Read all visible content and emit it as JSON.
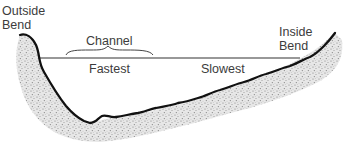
{
  "diagram": {
    "type": "river-channel-cross-section",
    "labels": {
      "outside_bend": [
        "Outside",
        "Bend"
      ],
      "inside_bend": [
        "Inside",
        "Bend"
      ],
      "channel": "Channel",
      "fastest": "Fastest",
      "slowest": "Slowest"
    },
    "colors": {
      "bank_line": "#111111",
      "water_line": "#333333",
      "sediment": "#9a9a9a",
      "text": "#3c3c3c"
    }
  }
}
